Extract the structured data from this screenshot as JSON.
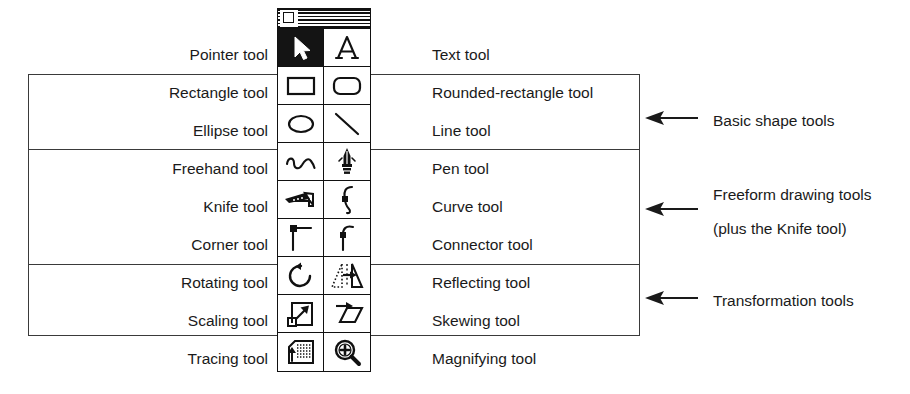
{
  "diagram": {
    "window": {
      "name": "tool-palette-window",
      "titlebar_style": "striped",
      "close_box": "close-box"
    },
    "rows": [
      {
        "left_label": "Pointer tool",
        "right_label": "Text tool",
        "left_icon": "pointer-arrow-icon",
        "right_icon": "text-letter-a-icon",
        "left_selected": true
      },
      {
        "left_label": "Rectangle tool",
        "right_label": "Rounded-rectangle tool",
        "left_icon": "rectangle-icon",
        "right_icon": "rounded-rectangle-icon",
        "left_selected": false
      },
      {
        "left_label": "Ellipse tool",
        "right_label": "Line tool",
        "left_icon": "ellipse-icon",
        "right_icon": "line-icon",
        "left_selected": false
      },
      {
        "left_label": "Freehand tool",
        "right_label": "Pen tool",
        "left_icon": "freehand-squiggle-icon",
        "right_icon": "pen-nib-icon",
        "left_selected": false
      },
      {
        "left_label": "Knife tool",
        "right_label": "Curve tool",
        "left_icon": "knife-icon",
        "right_icon": "curve-icon",
        "left_selected": false
      },
      {
        "left_label": "Corner tool",
        "right_label": "Connector tool",
        "left_icon": "corner-icon",
        "right_icon": "connector-icon",
        "left_selected": false
      },
      {
        "left_label": "Rotating tool",
        "right_label": "Reflecting tool",
        "left_icon": "rotate-arrow-icon",
        "right_icon": "reflect-triangle-icon",
        "left_selected": false
      },
      {
        "left_label": "Scaling tool",
        "right_label": "Skewing tool",
        "left_icon": "scale-arrow-icon",
        "right_icon": "skew-parallelogram-icon",
        "left_selected": false
      },
      {
        "left_label": "Tracing tool",
        "right_label": "Magnifying tool",
        "left_icon": "tracing-icon",
        "right_icon": "magnifying-glass-plus-icon",
        "left_selected": false
      }
    ],
    "callouts": [
      {
        "line1": "Basic shape tools",
        "line2": "",
        "arrow": "left-arrow-icon"
      },
      {
        "line1": "Freeform drawing tools",
        "line2": "(plus the Knife tool)",
        "arrow": "left-arrow-icon"
      },
      {
        "line1": "Transformation tools",
        "line2": "",
        "arrow": "left-arrow-icon"
      }
    ],
    "colors": {
      "ink": "#1a1a1a",
      "rule": "#3a3a3a",
      "selected_fill": "#141414",
      "background": "#ffffff"
    }
  }
}
